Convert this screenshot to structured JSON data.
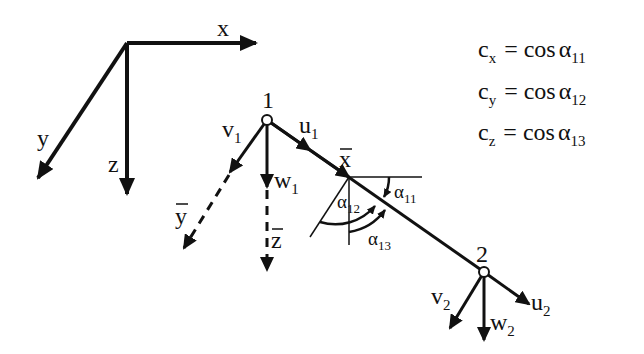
{
  "diagram": {
    "global_axes": {
      "x": "x",
      "y": "y",
      "z": "z"
    },
    "nodes": [
      {
        "id": "1",
        "label": "1"
      },
      {
        "id": "2",
        "label": "2"
      }
    ],
    "node1_dofs": {
      "u": {
        "base": "u",
        "sub": "1"
      },
      "v": {
        "base": "v",
        "sub": "1"
      },
      "w": {
        "base": "w",
        "sub": "1"
      }
    },
    "node2_dofs": {
      "u": {
        "base": "u",
        "sub": "2"
      },
      "v": {
        "base": "v",
        "sub": "2"
      },
      "w": {
        "base": "w",
        "sub": "2"
      }
    },
    "local_axes": {
      "x_bar": "x",
      "y_bar": "y",
      "z_bar": "z"
    },
    "angles": [
      {
        "base": "α",
        "sub": "11"
      },
      {
        "base": "α",
        "sub": "12"
      },
      {
        "base": "α",
        "sub": "13"
      }
    ],
    "equations": [
      {
        "lhs_base": "c",
        "lhs_sub": "x",
        "op": "=",
        "rhs": "cos",
        "angle_base": "α",
        "angle_sub": "11"
      },
      {
        "lhs_base": "c",
        "lhs_sub": "y",
        "op": "=",
        "rhs": "cos",
        "angle_base": "α",
        "angle_sub": "12"
      },
      {
        "lhs_base": "c",
        "lhs_sub": "z",
        "op": "=",
        "rhs": "cos",
        "angle_base": "α",
        "angle_sub": "13"
      }
    ]
  }
}
